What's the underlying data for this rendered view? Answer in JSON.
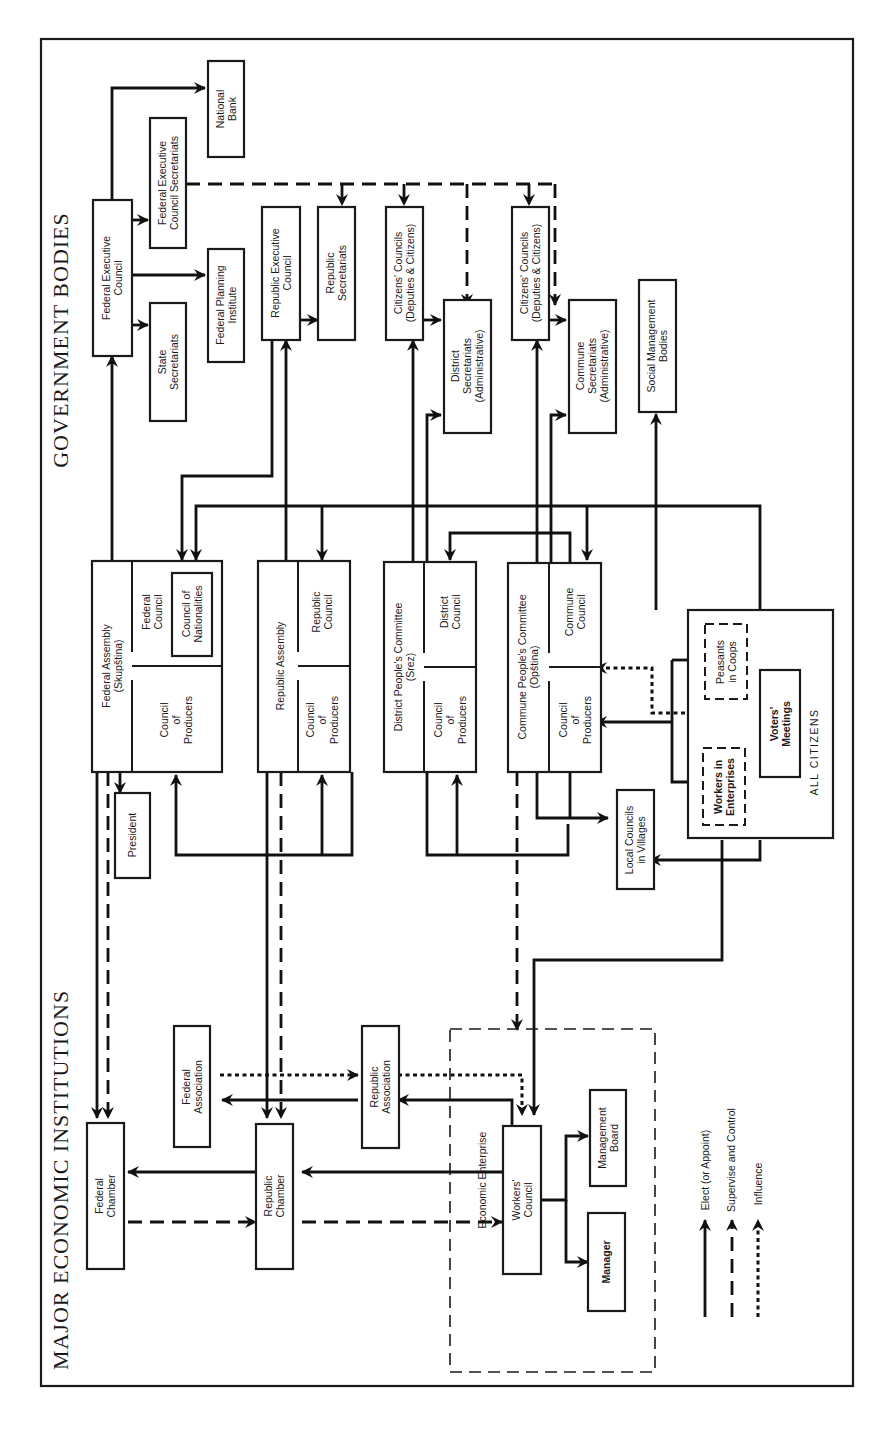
{
  "titles": {
    "government": "GOVERNMENT BODIES",
    "economic": "MAJOR ECONOMIC INSTITUTIONS"
  },
  "nodes": {
    "federal_executive_council": [
      "Federal Executive",
      "Council"
    ],
    "national_bank": [
      "National",
      "Bank"
    ],
    "fec_secretariats": [
      "Federal Executive",
      "Council Secretariats"
    ],
    "federal_planning_institute": [
      "Federal Planning",
      "Institute"
    ],
    "state_secretariats": [
      "State",
      "Secretariats"
    ],
    "republic_executive_council": [
      "Republic Executive",
      "Council"
    ],
    "republic_secretariats": [
      "Republic",
      "Secretariats"
    ],
    "citizens_councils_district": [
      "Citizens' Councils",
      "(Deputies & Citizens)"
    ],
    "district_secretariats": [
      "District",
      "Secretariats",
      "(Administrative)"
    ],
    "citizens_councils_commune": [
      "Citizens' Councils",
      "(Deputies & Citizens)"
    ],
    "commune_secretariats": [
      "Commune",
      "Secretariats",
      "(Administrative)"
    ],
    "social_management_bodies": [
      "Social Management",
      "Bodies"
    ],
    "federal_assembly": [
      "Federal Assembly",
      "(Skupština)"
    ],
    "federal_council": [
      "Federal",
      "Council"
    ],
    "council_of_nationalities": [
      "Council of",
      "Nationalities"
    ],
    "federal_council_of_producers": [
      "Council",
      "of",
      "Producers"
    ],
    "republic_assembly": [
      "Republic Assembly"
    ],
    "republic_council": [
      "Republic",
      "Council"
    ],
    "republic_council_of_producers": [
      "Council",
      "of",
      "Producers"
    ],
    "district_peoples_committee": [
      "District People's Committee",
      "(Srez)"
    ],
    "district_council": [
      "District",
      "Council"
    ],
    "district_council_of_producers": [
      "Council",
      "of",
      "Producers"
    ],
    "commune_peoples_committee": [
      "Commune People's Committee",
      "(Opština)"
    ],
    "commune_council": [
      "Commune",
      "Council"
    ],
    "commune_council_of_producers": [
      "Council",
      "of",
      "Producers"
    ],
    "president": [
      "President"
    ],
    "local_councils": [
      "Local Councils",
      "in Villages"
    ],
    "peasants_in_coops": [
      "Peasants",
      "in Coops"
    ],
    "voters_meetings": [
      "Voters'",
      "Meetings"
    ],
    "workers_in_enterprises": [
      "Workers in",
      "Enterprises"
    ],
    "all_citizens": [
      "ALL CITIZENS"
    ],
    "federal_association": [
      "Federal",
      "Association"
    ],
    "republic_association": [
      "Republic",
      "Association"
    ],
    "federal_chamber": [
      "Federal",
      "Chamber"
    ],
    "republic_chamber": [
      "Republic",
      "Chamber"
    ],
    "economic_enterprise": [
      "Economic Enterprise"
    ],
    "workers_council": [
      "Workers'",
      "Council"
    ],
    "management_board": [
      "Management",
      "Board"
    ],
    "manager": [
      "Manager"
    ]
  },
  "legend": {
    "items": [
      {
        "label": "Elect (or Appoint)",
        "style": "solid"
      },
      {
        "label": "Supervise and Control",
        "style": "dashed"
      },
      {
        "label": "Influence",
        "style": "dotted"
      }
    ]
  },
  "colors": {
    "ink": "#1a1a1a",
    "paper": "#ffffff"
  }
}
